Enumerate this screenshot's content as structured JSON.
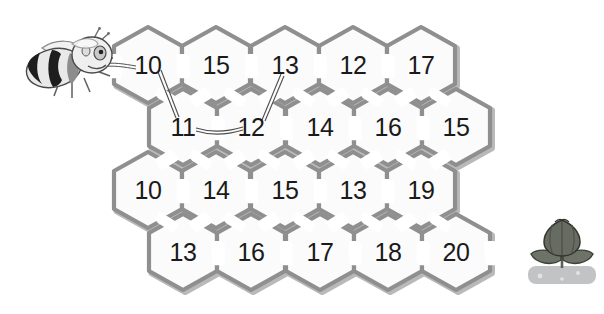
{
  "puzzle": {
    "title": "Honeycomb number maze",
    "entry_icon": "bee-icon",
    "exit_icon": "flower-icon",
    "background_color": "#ffffff",
    "comb_wall_color": "#8f8f8f",
    "comb_wall_shadow_color": "#b9b9b9",
    "comb_fill_color": "#fbfbfb",
    "label_color": "#1a1a1a",
    "path_line_color": "#4d4d4d"
  },
  "grid": {
    "rows": [
      {
        "row_index": 0,
        "y": 65,
        "cells": [
          {
            "value": "10",
            "x": 148
          },
          {
            "value": "15",
            "x": 216
          },
          {
            "value": "13",
            "x": 285
          },
          {
            "value": "12",
            "x": 353
          },
          {
            "value": "17",
            "x": 421
          }
        ]
      },
      {
        "row_index": 1,
        "y": 127,
        "cells": [
          {
            "value": "11",
            "x": 183
          },
          {
            "value": "12",
            "x": 251
          },
          {
            "value": "14",
            "x": 320
          },
          {
            "value": "16",
            "x": 388
          },
          {
            "value": "15",
            "x": 456
          }
        ]
      },
      {
        "row_index": 2,
        "y": 190,
        "cells": [
          {
            "value": "10",
            "x": 148
          },
          {
            "value": "14",
            "x": 216
          },
          {
            "value": "15",
            "x": 285
          },
          {
            "value": "13",
            "x": 353
          },
          {
            "value": "19",
            "x": 421
          }
        ]
      },
      {
        "row_index": 3,
        "y": 252,
        "cells": [
          {
            "value": "13",
            "x": 183
          },
          {
            "value": "16",
            "x": 251
          },
          {
            "value": "17",
            "x": 320
          },
          {
            "value": "18",
            "x": 388
          },
          {
            "value": "20",
            "x": 456
          }
        ]
      }
    ]
  },
  "markers": {
    "entry_label": "bee",
    "exit_label": "flower"
  }
}
